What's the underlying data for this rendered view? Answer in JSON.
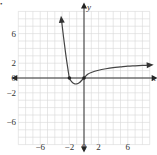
{
  "chart_data": {
    "type": "line",
    "title": "",
    "xlabel": "x",
    "ylabel": "y",
    "xlim": [
      -9,
      9
    ],
    "ylim": [
      -9,
      9
    ],
    "grid": true,
    "grid_step": 1,
    "x_tick_labels": [
      "-6",
      "-2",
      "0",
      "2",
      "6"
    ],
    "x_tick_values": [
      -6,
      -2,
      0,
      2,
      6
    ],
    "y_tick_labels": [
      "6",
      "2",
      "0",
      "-2",
      "-6"
    ],
    "y_tick_values": [
      6,
      2,
      0,
      -2,
      -6
    ],
    "series": [
      {
        "name": "f(x)",
        "x": [
          -3.1,
          -2.8,
          -2.5,
          -2.2,
          -2.0,
          -1.7,
          -1.4,
          -1.0,
          -0.6,
          -0.3,
          0.0,
          0.5,
          1.0,
          2.0,
          3.0,
          4.0,
          5.0,
          6.0,
          7.0,
          8.0,
          9.0
        ],
        "y": [
          8.0,
          5.5,
          3.2,
          1.2,
          0.0,
          -0.5,
          -0.75,
          -0.8,
          -0.6,
          -0.3,
          0.0,
          0.5,
          0.75,
          1.05,
          1.25,
          1.4,
          1.5,
          1.6,
          1.65,
          1.7,
          1.75
        ],
        "arrows": [
          "start",
          "end"
        ]
      }
    ],
    "marked_points": [
      {
        "x": -2,
        "y": 0
      },
      {
        "x": 0,
        "y": 0
      }
    ]
  },
  "labels": {
    "x_axis": "x",
    "y_axis": "y",
    "bullet": "•"
  }
}
